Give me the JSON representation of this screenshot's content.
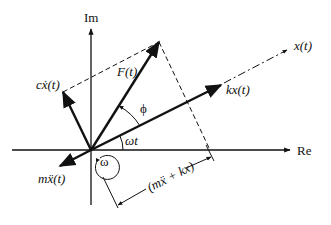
{
  "diagram": {
    "axes": {
      "real_label": "Re",
      "imag_label": "Im"
    },
    "vectors": {
      "displacement": {
        "label": "x(t)"
      },
      "spring_force": {
        "label": "kx(t)"
      },
      "applied_force": {
        "label": "F(t)"
      },
      "damping_force": {
        "label": "cẋ(t)"
      },
      "inertia_force": {
        "label": "mẍ(t)"
      }
    },
    "angles": {
      "phase": "ϕ",
      "omega_t": "ωt",
      "rotation": "ω"
    },
    "dimension": {
      "label": "(mẍ + kx)"
    },
    "colors": {
      "ink": "#111111",
      "background": "#ffffff"
    }
  }
}
